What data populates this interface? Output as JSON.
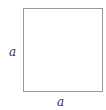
{
  "diagram": {
    "shape": "square",
    "border_color": "#9a9a9a",
    "labels": {
      "left_side": "a",
      "bottom_side": "a"
    }
  }
}
